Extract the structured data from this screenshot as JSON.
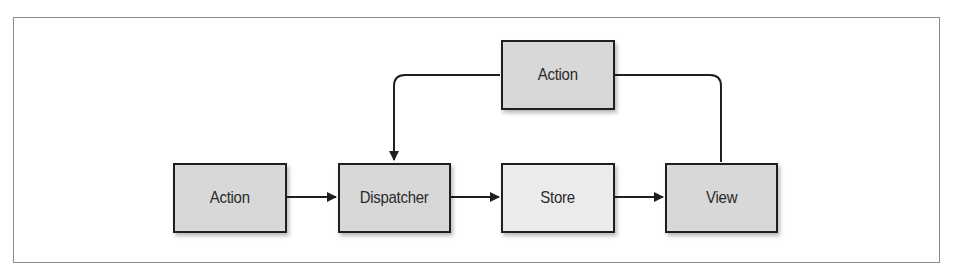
{
  "diagram": {
    "type": "flowchart",
    "title": "",
    "colors": {
      "node_fill": "#d8d8d8",
      "store_fill": "#ebebeb",
      "node_border": "#1f1f1f",
      "edge": "#1f1f1f",
      "frame_border": "#8a8a8a",
      "background": "#ffffff"
    },
    "nodes": [
      {
        "id": "action_bottom",
        "label": "Action"
      },
      {
        "id": "dispatcher",
        "label": "Dispatcher"
      },
      {
        "id": "store",
        "label": "Store"
      },
      {
        "id": "view",
        "label": "View"
      },
      {
        "id": "action_top",
        "label": "Action"
      }
    ],
    "edges": [
      {
        "from": "action_bottom",
        "to": "dispatcher",
        "arrow": true
      },
      {
        "from": "dispatcher",
        "to": "store",
        "arrow": true
      },
      {
        "from": "store",
        "to": "view",
        "arrow": true
      },
      {
        "from": "view",
        "to": "action_top",
        "arrow": false
      },
      {
        "from": "action_top",
        "to": "dispatcher",
        "arrow": true
      }
    ]
  }
}
